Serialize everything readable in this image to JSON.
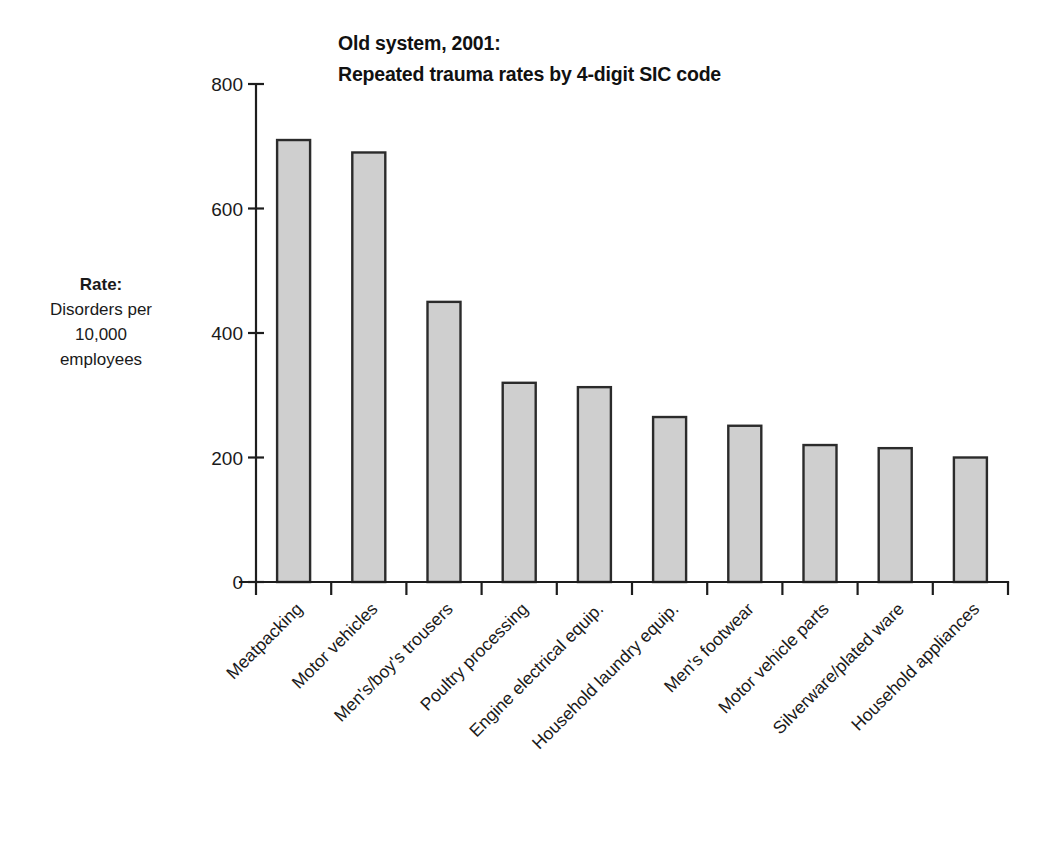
{
  "chart_data": {
    "type": "bar",
    "title": "Old system, 2001: Repeated trauma rates by 4-digit SIC code",
    "title_lines": [
      "Old system, 2001:",
      "Repeated trauma rates by 4-digit SIC code"
    ],
    "ylabel_lines": [
      "Rate:",
      "Disorders per",
      "10,000",
      "employees"
    ],
    "ylabel_head": "Rate:",
    "xlabel": "",
    "categories": [
      "Meatpacking",
      "Motor vehicles",
      "Men's/boy's trousers",
      "Poultry processing",
      "Engine electrical equip.",
      "Household laundry equip.",
      "Men's footwear",
      "Motor vehicle parts",
      "Silverware/plated ware",
      "Household appliances"
    ],
    "values": [
      710,
      690,
      450,
      320,
      313,
      265,
      251,
      220,
      215,
      200
    ],
    "ylim": [
      0,
      800
    ],
    "yticks": [
      0,
      200,
      400,
      600,
      800
    ],
    "ytick_labels": [
      "0",
      "200",
      "400",
      "600",
      "800"
    ],
    "grid": false,
    "legend": null,
    "bar_color": "#cfcfcf",
    "bar_edge_color": "#2b2b2b",
    "axis_color": "#1d1d1d",
    "label_rotation": -45
  }
}
